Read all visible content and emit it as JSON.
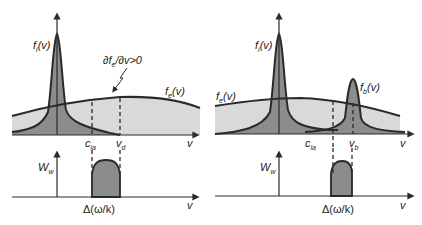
{
  "panels": {
    "top_left": {
      "ion_dist": {
        "sym": "f",
        "sub": "i",
        "arg": "(v)"
      },
      "electron_dist": {
        "sym": "f",
        "sub": "e",
        "arg": "(v)"
      },
      "annotation": {
        "pre": "∂f",
        "sub": "e",
        "post": "/∂v>0"
      },
      "marker1": {
        "sym": "c",
        "sub": "ia"
      },
      "marker2": {
        "sym": "v",
        "sub": "d"
      },
      "x_axis": "v"
    },
    "top_right": {
      "ion_dist": {
        "sym": "f",
        "sub": "i",
        "arg": "(v)"
      },
      "electron_dist": {
        "sym": "f",
        "sub": "e",
        "arg": "(v)"
      },
      "beam_dist": {
        "sym": "f",
        "sub": "b",
        "arg": "(v)"
      },
      "marker1": {
        "sym": "c",
        "sub": "ia"
      },
      "marker2": {
        "sym": "v",
        "sub": "b"
      },
      "x_axis": "v"
    },
    "bottom_left": {
      "y_axis": {
        "sym": "W",
        "sub": "w"
      },
      "width_label": "Δ(ω/k)",
      "x_axis": "v"
    },
    "bottom_right": {
      "y_axis": {
        "sym": "W",
        "sub": "w"
      },
      "width_label": "Δ(ω/k)",
      "x_axis": "v"
    }
  },
  "colors": {
    "ink": "#2a2a2a",
    "light_fill": "#d9d9d9",
    "dark_fill": "#8c8c8c"
  }
}
